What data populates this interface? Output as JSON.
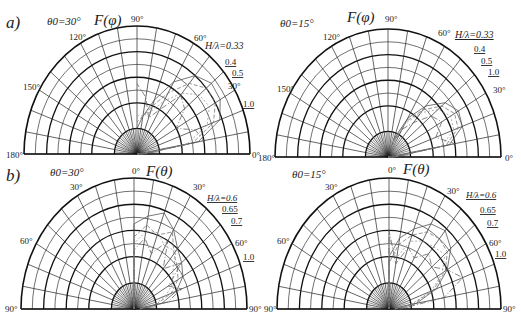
{
  "figure": {
    "panel_a_label": "a)",
    "panel_b_label": "b)"
  },
  "chart_data": [
    {
      "type": "polar",
      "panel": "a",
      "title": "F(φ)",
      "condition": "θ0=30°",
      "angle_ticks": [
        "180°",
        "150°",
        "120°",
        "90°",
        "60°",
        "30°",
        "0°"
      ],
      "radial_range": [
        0,
        1
      ],
      "legend_title": "H/λ",
      "series": [
        {
          "name": "0.33",
          "values_deg": [
            0,
            10,
            20,
            30,
            40,
            50,
            60,
            70,
            80,
            90
          ],
          "r": [
            0.05,
            0.55,
            0.78,
            0.85,
            0.86,
            0.8,
            0.65,
            0.45,
            0.3,
            0.2
          ]
        },
        {
          "name": "0.4",
          "values_deg": [
            0,
            10,
            20,
            30,
            40,
            50,
            60,
            70,
            80,
            90
          ],
          "r": [
            0.05,
            0.5,
            0.72,
            0.8,
            0.8,
            0.72,
            0.55,
            0.4,
            0.3,
            0.25
          ]
        },
        {
          "name": "0.5",
          "values_deg": [
            0,
            10,
            20,
            30,
            40,
            50,
            60,
            70,
            80,
            90
          ],
          "r": [
            0.05,
            0.45,
            0.66,
            0.74,
            0.72,
            0.62,
            0.48,
            0.35,
            0.3,
            0.3
          ]
        },
        {
          "name": "1.0",
          "values_deg": [
            0,
            10,
            20,
            30,
            40,
            50,
            60,
            70,
            80,
            90
          ],
          "r": [
            0.05,
            0.6,
            0.55,
            0.4,
            0.55,
            0.6,
            0.4,
            0.3,
            0.45,
            0.55
          ]
        }
      ]
    },
    {
      "type": "polar",
      "panel": "a",
      "title": "F(φ)",
      "condition": "θ0=15°",
      "angle_ticks": [
        "180°",
        "150°",
        "120°",
        "90°",
        "60°",
        "30°",
        "0°"
      ],
      "radial_range": [
        0,
        1
      ],
      "legend_title": "H/λ",
      "series": [
        {
          "name": "0.33",
          "values_deg": [
            0,
            10,
            20,
            30,
            40,
            50,
            60,
            70
          ],
          "r": [
            0.05,
            0.55,
            0.7,
            0.72,
            0.66,
            0.52,
            0.35,
            0.15
          ]
        },
        {
          "name": "0.4",
          "values_deg": [
            0,
            10,
            20,
            30,
            40,
            50,
            60,
            70
          ],
          "r": [
            0.05,
            0.52,
            0.66,
            0.68,
            0.62,
            0.48,
            0.32,
            0.12
          ]
        },
        {
          "name": "0.5",
          "values_deg": [
            0,
            10,
            20,
            30,
            40,
            50,
            60,
            70
          ],
          "r": [
            0.05,
            0.48,
            0.62,
            0.64,
            0.58,
            0.45,
            0.3,
            0.1
          ]
        },
        {
          "name": "1.0",
          "values_deg": [
            0,
            10,
            20,
            30,
            40,
            50,
            60,
            70
          ],
          "r": [
            0.05,
            0.6,
            0.45,
            0.55,
            0.5,
            0.35,
            0.25,
            0.1
          ]
        }
      ]
    },
    {
      "type": "polar",
      "panel": "b",
      "title": "F(θ)",
      "condition": "θ0=30°",
      "angle_ticks": [
        "90°",
        "60°",
        "30°",
        "0°",
        "30°",
        "60°",
        "90°"
      ],
      "radial_range": [
        0,
        1
      ],
      "legend_title": "H/λ",
      "series": [
        {
          "name": "0.6",
          "values_deg": [
            0,
            10,
            20,
            30,
            40,
            50,
            60,
            70,
            80,
            90
          ],
          "r": [
            0.65,
            0.72,
            0.78,
            0.7,
            0.6,
            0.55,
            0.5,
            0.4,
            0.25,
            0.05
          ]
        },
        {
          "name": "0.65",
          "values_deg": [
            0,
            10,
            20,
            30,
            40,
            50,
            60,
            70,
            80,
            90
          ],
          "r": [
            0.55,
            0.65,
            0.6,
            0.68,
            0.55,
            0.5,
            0.45,
            0.35,
            0.2,
            0.05
          ]
        },
        {
          "name": "0.7",
          "values_deg": [
            0,
            10,
            20,
            30,
            40,
            50,
            60,
            70,
            80,
            90
          ],
          "r": [
            0.5,
            0.6,
            0.62,
            0.55,
            0.58,
            0.45,
            0.4,
            0.3,
            0.18,
            0.05
          ]
        },
        {
          "name": "1.0",
          "values_deg": [
            0,
            10,
            20,
            30,
            40,
            50,
            60,
            70,
            80,
            90
          ],
          "r": [
            0.45,
            0.55,
            0.45,
            0.6,
            0.4,
            0.55,
            0.35,
            0.45,
            0.3,
            0.05
          ]
        }
      ]
    },
    {
      "type": "polar",
      "panel": "b",
      "title": "F(θ)",
      "condition": "θ0=15°",
      "angle_ticks": [
        "90°",
        "60°",
        "30°",
        "0°",
        "30°",
        "60°",
        "90°"
      ],
      "radial_range": [
        0,
        1
      ],
      "legend_title": "H/λ",
      "series": [
        {
          "name": "0.6",
          "values_deg": [
            0,
            10,
            20,
            30,
            40,
            50,
            60,
            70,
            80,
            90
          ],
          "r": [
            0.4,
            0.55,
            0.65,
            0.75,
            0.78,
            0.72,
            0.6,
            0.45,
            0.25,
            0.05
          ]
        },
        {
          "name": "0.65",
          "values_deg": [
            0,
            10,
            20,
            30,
            40,
            50,
            60,
            70,
            80,
            90
          ],
          "r": [
            0.35,
            0.5,
            0.6,
            0.68,
            0.7,
            0.68,
            0.58,
            0.42,
            0.22,
            0.05
          ]
        },
        {
          "name": "0.7",
          "values_deg": [
            0,
            10,
            20,
            30,
            40,
            50,
            60,
            70,
            80,
            90
          ],
          "r": [
            0.55,
            0.4,
            0.55,
            0.6,
            0.62,
            0.65,
            0.55,
            0.4,
            0.2,
            0.05
          ]
        },
        {
          "name": "1.0",
          "values_deg": [
            0,
            10,
            20,
            30,
            40,
            50,
            60,
            70,
            80,
            90
          ],
          "r": [
            0.6,
            0.35,
            0.5,
            0.45,
            0.55,
            0.5,
            0.6,
            0.7,
            0.5,
            0.1
          ]
        }
      ]
    }
  ],
  "labels": {
    "a_left": {
      "condition": "θ0=30°",
      "title": "F(φ)",
      "ticks": {
        "t180": "180°",
        "t150": "150°",
        "t120": "120°",
        "t90": "90°",
        "t60": "60°",
        "t30": "30°",
        "t0": "0°"
      },
      "legend": [
        "H/λ=0.33",
        "0.4",
        "0.5",
        "1.0"
      ]
    },
    "a_right": {
      "condition": "θ0=15°",
      "title": "F(φ)",
      "ticks": {
        "t180": "180°",
        "t150": "150°",
        "t120": "120°",
        "t90": "90°",
        "t60": "60°",
        "t30": "30°",
        "t0": "0°"
      },
      "legend": [
        "H/λ=0.33",
        "0.4",
        "0.5",
        "1.0"
      ]
    },
    "b_left": {
      "condition": "θ0=30°",
      "title": "F(θ)",
      "ticks": {
        "l90": "90°",
        "l60": "60°",
        "l30": "30°",
        "c0": "0°",
        "r30": "30°",
        "r60": "60°",
        "r90": "90°"
      },
      "legend": [
        "H/λ=0.6",
        "0.65",
        "0.7",
        "1.0"
      ]
    },
    "b_right": {
      "condition": "θ0=15°",
      "title": "F(θ)",
      "ticks": {
        "l90": "90°",
        "l60": "60°",
        "l30": "30°",
        "c0": "0°",
        "r30": "30°",
        "r60": "60°",
        "r90": "90°"
      },
      "legend": [
        "H/λ=0.6",
        "0.65",
        "0.7",
        "1.0"
      ]
    }
  }
}
